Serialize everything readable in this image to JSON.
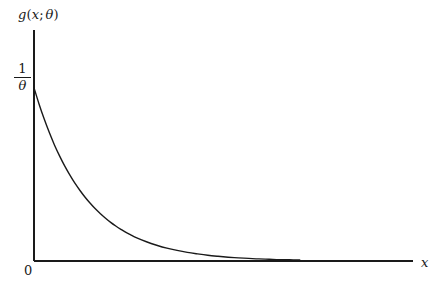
{
  "figure": {
    "background_color": "#ffffff",
    "ink_color": "#1a1a1a",
    "width": 436,
    "height": 294
  },
  "labels": {
    "y_axis_title_fn": "g",
    "y_axis_title_open": "(",
    "y_axis_title_var": "x",
    "y_axis_title_sep": ";",
    "y_axis_title_param": "θ",
    "y_axis_title_close": ")",
    "y_axis_title_full": "g(x; θ)",
    "x_axis_title": "x",
    "origin_tick": "0",
    "y_tick_numerator": "1",
    "y_tick_denominator": "θ",
    "y_tick_full": "1/θ"
  },
  "chart_data": {
    "type": "line",
    "title": "",
    "subtitle": "",
    "xlabel": "x",
    "ylabel": "g(x; θ)",
    "grid": false,
    "legend": null,
    "annotations": [],
    "function": "g(x; θ) = (1/θ) e^(-x/θ)",
    "axis_ticks": {
      "x": [
        "0"
      ],
      "y": [
        "1/θ"
      ]
    },
    "xlim": [
      0,
      6.32
    ],
    "ylim": [
      0,
      1.085
    ],
    "series": [
      {
        "name": "g(x; θ)",
        "color": "#1a1a1a",
        "linewidth": 1.4,
        "x": [
          0.0,
          0.1,
          0.2,
          0.3,
          0.4,
          0.5,
          0.6,
          0.7,
          0.8,
          0.9,
          1.0,
          1.1,
          1.2,
          1.3,
          1.4,
          1.5,
          1.6,
          1.7,
          1.8,
          1.9,
          2.0,
          2.2,
          2.4,
          2.6,
          2.8,
          3.0,
          3.2,
          3.4,
          3.6,
          3.8,
          4.0,
          4.2,
          4.4,
          4.6,
          4.8,
          5.0,
          5.2
        ],
        "y": [
          1.0,
          0.905,
          0.819,
          0.741,
          0.67,
          0.607,
          0.549,
          0.497,
          0.449,
          0.407,
          0.368,
          0.333,
          0.301,
          0.273,
          0.247,
          0.223,
          0.202,
          0.183,
          0.165,
          0.15,
          0.135,
          0.111,
          0.091,
          0.074,
          0.061,
          0.05,
          0.041,
          0.033,
          0.027,
          0.022,
          0.018,
          0.015,
          0.012,
          0.01,
          0.008,
          0.007,
          0.006
        ]
      }
    ],
    "axes": {
      "x_axis_drawn": true,
      "y_axis_drawn": true,
      "x_axis_has_arrow": false,
      "y_axis_has_arrow": false,
      "spines": [
        "left",
        "bottom"
      ]
    }
  },
  "geometry": {
    "origin_px": [
      34,
      261
    ],
    "y_axis_top_px": 30,
    "x_axis_right_px": 413,
    "curve_start_px": [
      34,
      73
    ],
    "curve_end_px": [
      357,
      252
    ],
    "decay_constant_px": 65
  }
}
